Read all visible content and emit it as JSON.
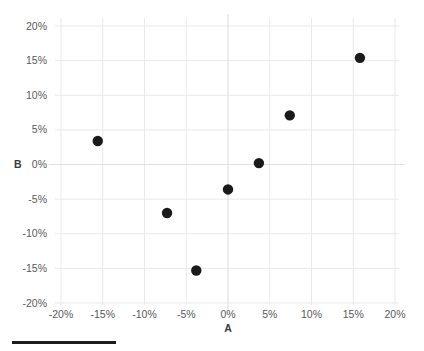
{
  "chart_data": {
    "type": "scatter",
    "title": "",
    "xlabel": "A",
    "ylabel": "B",
    "xlim": [
      -20,
      20
    ],
    "ylim": [
      -20,
      20
    ],
    "grid": true,
    "legend": null,
    "x_tick_labels": [
      "-20%",
      "-15%",
      "-10%",
      "-5%",
      "0%",
      "5%",
      "10%",
      "15%",
      "20%"
    ],
    "x_tick_values": [
      -20,
      -15,
      -10,
      -5,
      0,
      5,
      10,
      15,
      20
    ],
    "y_tick_labels": [
      "20%",
      "15%",
      "10%",
      "5%",
      "0%",
      "-5%",
      "-10%",
      "-15%",
      "-20%"
    ],
    "y_tick_values": [
      20,
      15,
      10,
      5,
      0,
      -5,
      -10,
      -15,
      -20
    ],
    "series": [
      {
        "name": "points",
        "marker": "circle",
        "color": "#1a1a1a",
        "points": [
          {
            "x": -15.6,
            "y": 3.4
          },
          {
            "x": -7.3,
            "y": -7.0
          },
          {
            "x": -3.8,
            "y": -15.3
          },
          {
            "x": 0.0,
            "y": -3.6
          },
          {
            "x": 3.7,
            "y": 0.2
          },
          {
            "x": 7.4,
            "y": 7.1
          },
          {
            "x": 15.8,
            "y": 15.4
          }
        ]
      }
    ]
  },
  "decor": {
    "rule_color": "#1c1c1c"
  }
}
